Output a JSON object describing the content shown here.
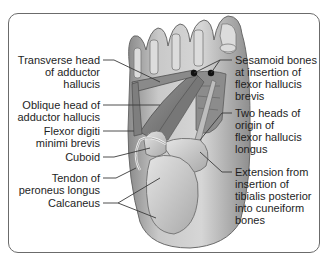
{
  "figure": {
    "labels_left": [
      {
        "id": "transverse-head-adductor-hallucis",
        "text": "Transverse head\nof adductor\nhallucis"
      },
      {
        "id": "oblique-head-adductor-hallucis",
        "text": "Oblique head of\nadductor hallucis"
      },
      {
        "id": "flexor-digiti-minimi-brevis",
        "text": "Flexor digiti\nminimi brevis"
      },
      {
        "id": "cuboid",
        "text": "Cuboid"
      },
      {
        "id": "tendon-peroneus-longus",
        "text": "Tendon of\nperoneus longus"
      },
      {
        "id": "calcaneus",
        "text": "Calcaneus"
      }
    ],
    "labels_right": [
      {
        "id": "sesamoid-bones",
        "text": "Sesamoid bones\nat insertion of\nflexor hallucis\nbrevis"
      },
      {
        "id": "two-heads-flexor-hallucis-longus",
        "text": "Two heads of\norigin of\nflexor hallucis\nlongus"
      },
      {
        "id": "extension-tibialis-posterior",
        "text": "Extension from\ninsertion of\ntibialis posterior\ninto cuneiform\nbones"
      }
    ]
  }
}
